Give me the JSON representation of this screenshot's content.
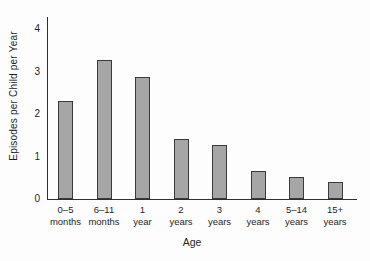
{
  "chart_data": {
    "type": "bar",
    "title": "",
    "ylabel": "Episodes per Child per Year",
    "xlabel": "Age",
    "categories": [
      "0–5 months",
      "6–11 months",
      "1 year",
      "2 years",
      "3 years",
      "4 years",
      "5–14 years",
      "15+ years"
    ],
    "category_lines": [
      [
        "0–5",
        "months"
      ],
      [
        "6–11",
        "months"
      ],
      [
        "1",
        "year"
      ],
      [
        "2",
        "years"
      ],
      [
        "3",
        "years"
      ],
      [
        "4",
        "years"
      ],
      [
        "5–14",
        "years"
      ],
      [
        "15+",
        "years"
      ]
    ],
    "values": [
      2.3,
      3.25,
      2.85,
      1.4,
      1.25,
      0.65,
      0.5,
      0.4
    ],
    "yticks": [
      0,
      1,
      2,
      3,
      4
    ],
    "ylim": [
      0,
      4.3
    ],
    "grid": false,
    "legend_position": "none",
    "colors": {
      "bar_fill": "#a6a6a6",
      "bar_border": "#3a3a3a",
      "axis": "#2f2f2f",
      "text": "#1f1f1f",
      "background": "#fdfdfd"
    }
  }
}
